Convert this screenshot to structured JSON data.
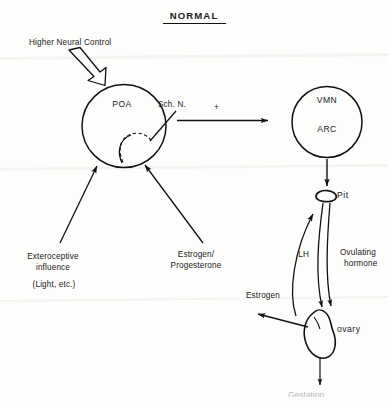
{
  "document": {
    "title": "NORMAL",
    "title_underlined": true,
    "background_color": "#fdfdfc",
    "ink_color": "#111111",
    "style": "hand-drawn pen diagram on paper"
  },
  "nodes": {
    "poa": "POA",
    "vmn": "VMN",
    "arc": "ARC",
    "pit": "Pit",
    "ovary": "ovary"
  },
  "labels": {
    "higher_neural_control": "Higher Neural Control",
    "sch_n": "Sch. N.",
    "plus_sign": "+",
    "exteroceptive_line1": "Exteroceptive",
    "exteroceptive_line2": "influence",
    "exteroceptive_line3": "(Light, etc.)",
    "estrogen_progesterone_line1": "Estrogen/",
    "estrogen_progesterone_line2": "Progesterone",
    "lh": "LH",
    "ovulating_hormone_line1": "Ovulating",
    "ovulating_hormone_line2": "hormone",
    "estrogen": "Estrogen",
    "bottom_clipped": "Gestation"
  },
  "annotations": {
    "bottom_note": "text clipped at image edge, illegible"
  }
}
